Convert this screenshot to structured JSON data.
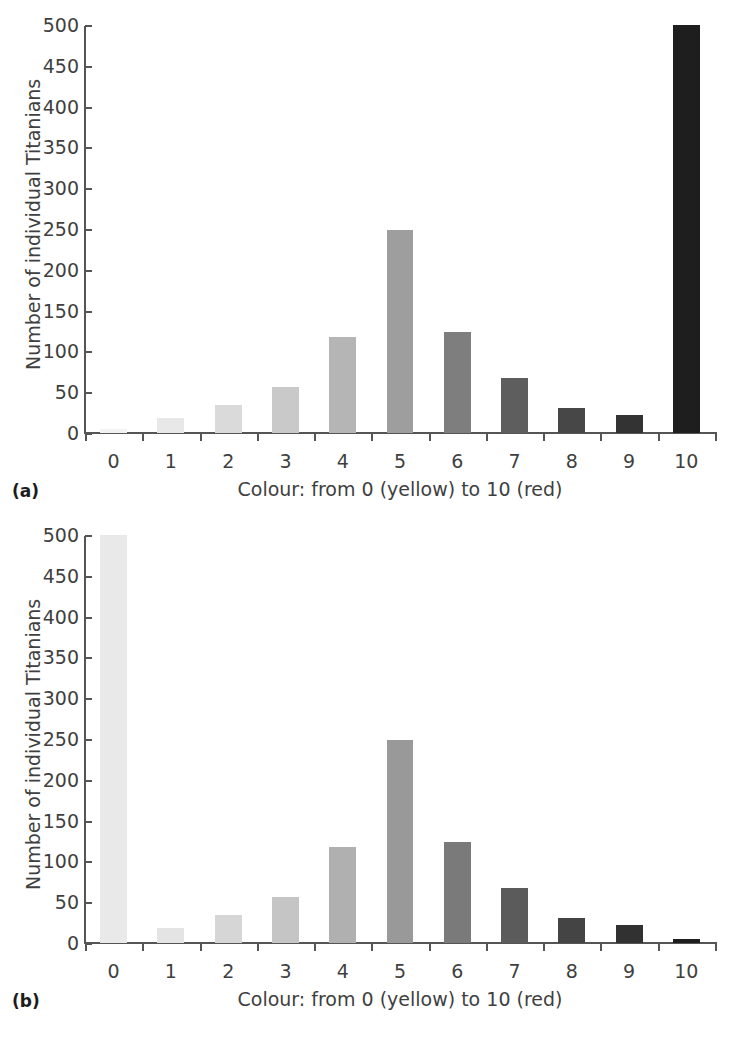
{
  "figure": {
    "y_axis_label": "Number of individual Titanians",
    "x_axis_label": "Colour: from 0 (yellow) to 10 (red)",
    "y_ticks": [
      "0",
      "50",
      "100",
      "150",
      "200",
      "250",
      "300",
      "350",
      "400",
      "450",
      "500"
    ],
    "x_ticks": [
      "0",
      "1",
      "2",
      "3",
      "4",
      "5",
      "6",
      "7",
      "8",
      "9",
      "10"
    ],
    "panel_a_tag": "(a)",
    "panel_b_tag": "(b)",
    "axis_color": "#555555",
    "text_color": "#3f3f3f"
  },
  "chart_data": [
    {
      "type": "bar",
      "panel": "(a)",
      "title": "",
      "xlabel": "Colour: from 0 (yellow) to 10 (red)",
      "ylabel": "Number of individual Titanians",
      "categories": [
        "0",
        "1",
        "2",
        "3",
        "4",
        "5",
        "6",
        "7",
        "8",
        "9",
        "10"
      ],
      "values": [
        5,
        19,
        34,
        56,
        118,
        249,
        124,
        67,
        31,
        22,
        500
      ],
      "bar_colors": [
        "#f2f2f2",
        "#e8e8e8",
        "#dadada",
        "#c9c9c9",
        "#b5b5b5",
        "#9e9e9e",
        "#7e7e7e",
        "#5e5e5e",
        "#474747",
        "#333333",
        "#1e1e1e"
      ],
      "ylim": [
        0,
        500
      ],
      "ytick_step": 50,
      "grid": false,
      "legend": "none"
    },
    {
      "type": "bar",
      "panel": "(b)",
      "title": "",
      "xlabel": "Colour: from 0 (yellow) to 10 (red)",
      "ylabel": "Number of individual Titanians",
      "categories": [
        "0",
        "1",
        "2",
        "3",
        "4",
        "5",
        "6",
        "7",
        "8",
        "9",
        "10"
      ],
      "values": [
        500,
        19,
        34,
        57,
        118,
        249,
        124,
        67,
        31,
        22,
        5
      ],
      "bar_colors": [
        "#e9e9e9",
        "#e4e4e4",
        "#d6d6d6",
        "#c5c5c5",
        "#b0b0b0",
        "#999999",
        "#7a7a7a",
        "#5b5b5b",
        "#444444",
        "#313131",
        "#1e1e1e"
      ],
      "ylim": [
        0,
        500
      ],
      "ytick_step": 50,
      "grid": false,
      "legend": "none"
    }
  ]
}
